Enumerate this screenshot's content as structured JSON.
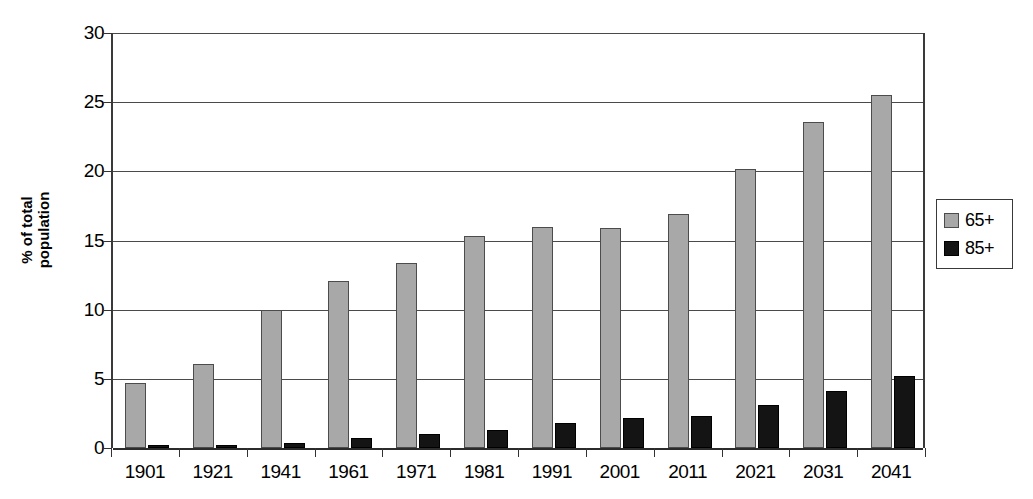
{
  "chart_data": {
    "type": "bar",
    "title": "",
    "subtitle": "",
    "xlabel": "",
    "ylabel": "% of total population",
    "ylabel_lines": [
      "% of total",
      "population"
    ],
    "categories": [
      "1901",
      "1921",
      "1941",
      "1961",
      "1971",
      "1981",
      "1991",
      "2001",
      "2011",
      "2021",
      "2031",
      "2041"
    ],
    "series": [
      {
        "name": "65+",
        "color": "#a8a8a8",
        "values": [
          4.7,
          6.1,
          10.0,
          12.1,
          13.4,
          15.3,
          16.0,
          15.9,
          16.9,
          20.2,
          23.6,
          25.5
        ]
      },
      {
        "name": "85+",
        "color": "#141414",
        "values": [
          0.2,
          0.25,
          0.35,
          0.7,
          1.0,
          1.3,
          1.8,
          2.2,
          2.35,
          3.1,
          4.15,
          5.2
        ]
      }
    ],
    "ylim": [
      0,
      30
    ],
    "ytick_values": [
      0,
      5,
      10,
      15,
      20,
      25,
      30
    ],
    "ytick_labels": [
      "0",
      "5",
      "10",
      "15",
      "20",
      "25",
      "30"
    ],
    "grid": true,
    "grid_axis": "y",
    "legend": {
      "position": "right",
      "entries": [
        {
          "label": "65+",
          "swatch": "series-65-swatch"
        },
        {
          "label": "85+",
          "swatch": "series-85-swatch"
        }
      ]
    },
    "axis_color": "#3a3a3a",
    "background": "#ffffff"
  }
}
